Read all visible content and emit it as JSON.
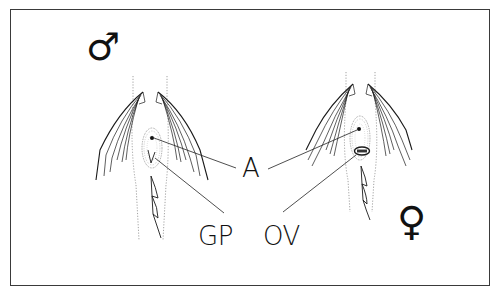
{
  "figure": {
    "type": "anatomical diagram",
    "panels": [
      {
        "id": "male",
        "symbol": "♂",
        "description": "male specimen, ventral view with paired fins, anal region and genital papilla"
      },
      {
        "id": "female",
        "symbol": "♀",
        "description": "female specimen, ventral view with paired fins, anal region and ovipositor"
      }
    ],
    "labels": {
      "anus": "A",
      "genital_papilla": "GP",
      "ovipositor": "OV"
    },
    "colors": {
      "line": "#1a1a1a",
      "dotted": "#8a8a8a",
      "frame": "#3a3a3a",
      "background": "#ffffff"
    }
  }
}
